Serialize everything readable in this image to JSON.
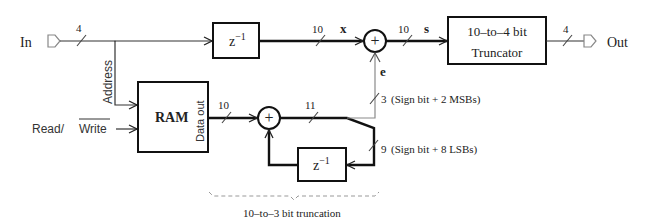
{
  "diagram": {
    "ports": {
      "input_label": "In",
      "output_label": "Out"
    },
    "blocks": {
      "delay_top": {
        "label": "z",
        "exponent": "−1"
      },
      "ram": {
        "label": "RAM",
        "data_out_label": "Data out"
      },
      "truncator": {
        "line1": "10–to–4 bit",
        "line2": "Truncator"
      },
      "delay_bottom": {
        "label": "z",
        "exponent": "−1"
      }
    },
    "signals": {
      "address_label": "Address",
      "read_label": "Read/",
      "write_label": "Write",
      "x_label": "x",
      "s_label": "s",
      "e_label": "e"
    },
    "bus_widths": {
      "input": "4",
      "delay_out": "10",
      "sum_out": "10",
      "output": "4",
      "ram_out": "10",
      "acc_out": "11",
      "msb_path": "3",
      "lsb_path": "9"
    },
    "annotations": {
      "msb_note": "(Sign bit + 2 MSBs)",
      "lsb_note": "(Sign bit + 8 LSBs)",
      "brace_label": "10–to–3 bit truncation"
    },
    "summer_symbol": "+"
  }
}
